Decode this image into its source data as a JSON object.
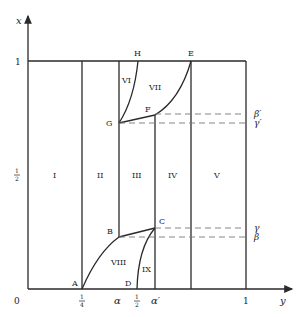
{
  "axes": {
    "x_axis_label": "y",
    "y_axis_label": "x",
    "origin_label": "0",
    "x_ticks": [
      {
        "label_num": "1",
        "label_den": "4",
        "pos": 82
      },
      {
        "label": "α",
        "pos": 119
      },
      {
        "label_num": "1",
        "label_den": "2",
        "pos": 137
      },
      {
        "label": "α′",
        "pos": 155
      },
      {
        "label": "1",
        "pos": 246
      }
    ],
    "y_ticks": [
      {
        "label": "1",
        "pos": 61
      },
      {
        "label_num": "1",
        "label_den": "2",
        "pos": 175
      }
    ]
  },
  "points": {
    "A": "A",
    "B": "B",
    "C": "C",
    "D": "D",
    "E": "E",
    "F": "F",
    "G": "G",
    "H": "H"
  },
  "regions": {
    "r1": "I",
    "r2": "II",
    "r3": "III",
    "r4": "IV",
    "r5": "V",
    "r6": "VI",
    "r7": "VII",
    "r8": "VIII",
    "r9": "IX"
  },
  "dashed_labels": {
    "beta_prime": "β′",
    "gamma_prime": "γ′",
    "gamma": "γ",
    "beta": "β"
  },
  "colors": {
    "line": "#2a2a2a",
    "dash": "#777777",
    "background": "#ffffff"
  }
}
